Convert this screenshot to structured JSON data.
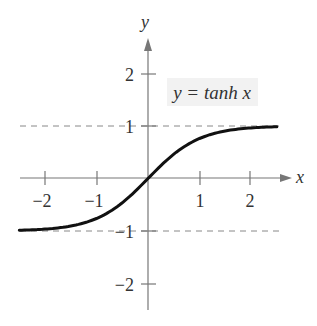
{
  "chart_data": {
    "type": "line",
    "title": "",
    "function": "y = tanh x",
    "xlabel": "x",
    "ylabel": "y",
    "xlim": [
      -2.5,
      2.5
    ],
    "ylim": [
      -2.5,
      2.7
    ],
    "x_ticks": [
      -2,
      -1,
      1,
      2
    ],
    "x_tick_labels": [
      "−2",
      "−1",
      "1",
      "2"
    ],
    "y_ticks": [
      2,
      1,
      -1,
      -2
    ],
    "y_tick_labels": [
      "2",
      "1",
      "−1",
      "−2"
    ],
    "asymptotes": [
      {
        "y": 1,
        "style": "dashed"
      },
      {
        "y": -1,
        "style": "dashed"
      }
    ],
    "series": [
      {
        "name": "y = tanh x",
        "x": [
          -2.5,
          -2,
          -1.5,
          -1,
          -0.5,
          0,
          0.5,
          1,
          1.5,
          2,
          2.5
        ],
        "y": [
          -0.987,
          -0.964,
          -0.905,
          -0.762,
          -0.462,
          0,
          0.462,
          0.762,
          0.905,
          0.964,
          0.987
        ]
      }
    ],
    "annotations": [
      {
        "text": "y = tanh x",
        "position": "upper right"
      }
    ],
    "grid": false,
    "legend": "none"
  },
  "labels": {
    "x_axis": "x",
    "y_axis": "y",
    "curve_label": "y = tanh x",
    "xt_m2": "−2",
    "xt_m1": "−1",
    "xt_1": "1",
    "xt_2": "2",
    "yt_2": "2",
    "yt_1": "1",
    "yt_m1": "−1",
    "yt_m2": "−2"
  }
}
